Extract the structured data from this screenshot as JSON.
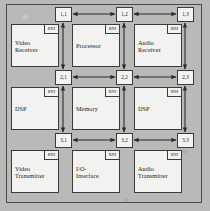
{
  "figure": {
    "background_color": "#b9b9b7",
    "block_fill": "#f2f2f0",
    "line_color": "#3b3b39"
  },
  "interface_badge": {
    "label": "RNI"
  },
  "routers": [
    {
      "id": "r11",
      "label": "1,1",
      "x": 55,
      "y": 7
    },
    {
      "id": "r12",
      "label": "1,2",
      "x": 116,
      "y": 7
    },
    {
      "id": "r13",
      "label": "1,3",
      "x": 177,
      "y": 7
    },
    {
      "id": "r21",
      "label": "2,1",
      "x": 55,
      "y": 70
    },
    {
      "id": "r22",
      "label": "2,2",
      "x": 116,
      "y": 70
    },
    {
      "id": "r23",
      "label": "2,3",
      "x": 177,
      "y": 70
    },
    {
      "id": "r31",
      "label": "3,1",
      "x": 55,
      "y": 133
    },
    {
      "id": "r32",
      "label": "3,2",
      "x": 116,
      "y": 133
    },
    {
      "id": "r33",
      "label": "3,3",
      "x": 177,
      "y": 133
    }
  ],
  "ip_blocks": [
    {
      "id": "ip11",
      "label": "Video\nReceiver",
      "x": 11,
      "y": 24,
      "w": 48,
      "h": 43
    },
    {
      "id": "ip12",
      "label": "Processor",
      "x": 72,
      "y": 24,
      "w": 48,
      "h": 43
    },
    {
      "id": "ip13",
      "label": "Audio\nReceiver",
      "x": 134,
      "y": 24,
      "w": 48,
      "h": 43
    },
    {
      "id": "ip21",
      "label": "DSP",
      "x": 11,
      "y": 87,
      "w": 48,
      "h": 43
    },
    {
      "id": "ip22",
      "label": "Memory",
      "x": 72,
      "y": 87,
      "w": 48,
      "h": 43
    },
    {
      "id": "ip23",
      "label": "DSP",
      "x": 134,
      "y": 87,
      "w": 48,
      "h": 43
    },
    {
      "id": "ip31",
      "label": "Video\nTransmitter",
      "x": 11,
      "y": 150,
      "w": 48,
      "h": 43
    },
    {
      "id": "ip32",
      "label": "I/O-\nInterface",
      "x": 72,
      "y": 150,
      "w": 48,
      "h": 43
    },
    {
      "id": "ip33",
      "label": "Audio\nTransmitter",
      "x": 134,
      "y": 150,
      "w": 48,
      "h": 43
    }
  ],
  "links": [
    {
      "id": "h-r11-r12",
      "from": "1,1",
      "to": "1,2",
      "orientation": "horizontal",
      "x1": 73,
      "y1": 14,
      "x2": 115,
      "y2": 14
    },
    {
      "id": "h-r12-r13",
      "from": "1,2",
      "to": "1,3",
      "orientation": "horizontal",
      "x1": 134,
      "y1": 14,
      "x2": 176,
      "y2": 14
    },
    {
      "id": "h-r21-r22",
      "from": "2,1",
      "to": "2,2",
      "orientation": "horizontal",
      "x1": 73,
      "y1": 77,
      "x2": 115,
      "y2": 77
    },
    {
      "id": "h-r22-r23",
      "from": "2,2",
      "to": "2,3",
      "orientation": "horizontal",
      "x1": 134,
      "y1": 77,
      "x2": 176,
      "y2": 77
    },
    {
      "id": "h-r31-r32",
      "from": "3,1",
      "to": "3,2",
      "orientation": "horizontal",
      "x1": 73,
      "y1": 140,
      "x2": 115,
      "y2": 140
    },
    {
      "id": "h-r32-r33",
      "from": "3,2",
      "to": "3,3",
      "orientation": "horizontal",
      "x1": 134,
      "y1": 140,
      "x2": 176,
      "y2": 140
    },
    {
      "id": "v-r11-r21",
      "from": "1,1",
      "to": "2,1",
      "orientation": "vertical",
      "x1": 63,
      "y1": 23,
      "x2": 63,
      "y2": 69
    },
    {
      "id": "v-r12-r22",
      "from": "1,2",
      "to": "2,2",
      "orientation": "vertical",
      "x1": 124,
      "y1": 23,
      "x2": 124,
      "y2": 69
    },
    {
      "id": "v-r13-r23",
      "from": "1,3",
      "to": "2,3",
      "orientation": "vertical",
      "x1": 185,
      "y1": 23,
      "x2": 185,
      "y2": 69
    },
    {
      "id": "v-r21-r31",
      "from": "2,1",
      "to": "3,1",
      "orientation": "vertical",
      "x1": 63,
      "y1": 86,
      "x2": 63,
      "y2": 132
    },
    {
      "id": "v-r22-r32",
      "from": "2,2",
      "to": "3,2",
      "orientation": "vertical",
      "x1": 124,
      "y1": 86,
      "x2": 124,
      "y2": 132
    },
    {
      "id": "v-r23-r33",
      "from": "2,3",
      "to": "3,3",
      "orientation": "vertical",
      "x1": 185,
      "y1": 86,
      "x2": 185,
      "y2": 132
    }
  ]
}
